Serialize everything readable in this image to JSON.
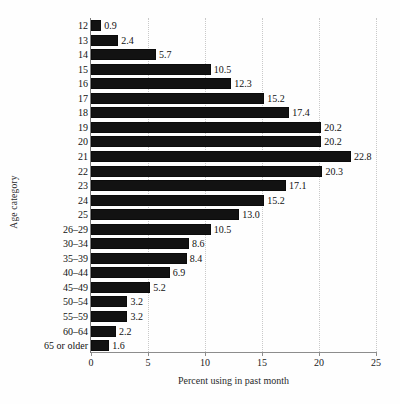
{
  "chart_data": {
    "type": "bar",
    "orientation": "horizontal",
    "title": "",
    "xlabel": "Percent using in past month",
    "ylabel": "Age category",
    "xlim": [
      0,
      25
    ],
    "xticks": [
      0,
      5,
      10,
      15,
      20,
      25
    ],
    "xtick_labels": [
      "0",
      "5",
      "10",
      "15",
      "20",
      "25"
    ],
    "grid": "vertical dotted gridlines at x ticks",
    "legend": "none",
    "bar_color": "#121212",
    "gridline_color": "#c9c9c9",
    "axis_color": "#8d8d8d",
    "categories": [
      "12",
      "13",
      "14",
      "15",
      "16",
      "17",
      "18",
      "19",
      "20",
      "21",
      "22",
      "23",
      "24",
      "25",
      "26–29",
      "30–34",
      "35–39",
      "40–44",
      "45–49",
      "50–54",
      "55–59",
      "60–64",
      "65 or older"
    ],
    "values": [
      0.9,
      2.4,
      5.7,
      10.5,
      12.3,
      15.2,
      17.4,
      20.2,
      20.2,
      22.8,
      20.3,
      17.1,
      15.2,
      13.0,
      10.5,
      8.6,
      8.4,
      6.9,
      5.2,
      3.2,
      3.2,
      2.2,
      1.6
    ],
    "value_labels": [
      "0.9",
      "2.4",
      "5.7",
      "10.5",
      "12.3",
      "15.2",
      "17.4",
      "20.2",
      "20.2",
      "22.8",
      "20.3",
      "17.1",
      "15.2",
      "13.0",
      "10.5",
      "8.6",
      "8.4",
      "6.9",
      "5.2",
      "3.2",
      "3.2",
      "2.2",
      "1.6"
    ]
  }
}
